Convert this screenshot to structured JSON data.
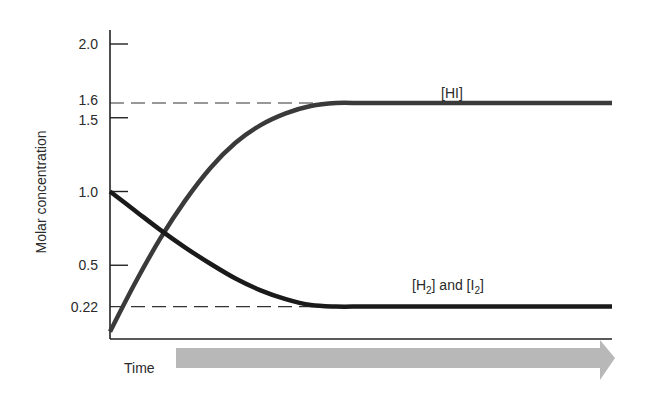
{
  "chart_data": {
    "type": "line",
    "title": "",
    "xlabel": "Time",
    "ylabel": "Molar concentration",
    "ylim": [
      0,
      2.0
    ],
    "xlim": [
      0,
      1
    ],
    "grid": false,
    "y_ticks": [
      {
        "value": 2.0,
        "label": "2.0",
        "tick": true
      },
      {
        "value": 1.6,
        "label": "1.6",
        "tick": false
      },
      {
        "value": 1.5,
        "label": "1.5",
        "tick": true
      },
      {
        "value": 1.0,
        "label": "1.0",
        "tick": true
      },
      {
        "value": 0.5,
        "label": "0.5",
        "tick": true
      },
      {
        "value": 0.22,
        "label": "0.22",
        "tick": false
      }
    ],
    "reference_lines": [
      {
        "name": "equilibrium-HI",
        "value": 1.6,
        "style": "dashed"
      },
      {
        "name": "equilibrium-H2-I2",
        "value": 0.22,
        "style": "dashed"
      }
    ],
    "series": [
      {
        "name": "[HI]",
        "color": "#3a3a3a",
        "x": [
          0.0,
          0.05,
          0.1,
          0.15,
          0.2,
          0.25,
          0.3,
          0.35,
          0.4,
          0.45,
          0.5,
          0.55,
          1.0
        ],
        "y": [
          0.05,
          0.38,
          0.68,
          0.94,
          1.16,
          1.33,
          1.45,
          1.53,
          1.58,
          1.6,
          1.6,
          1.6,
          1.6
        ]
      },
      {
        "name": "[H2] and [I2]",
        "color": "#1a1a1a",
        "x": [
          0.0,
          0.05,
          0.1,
          0.15,
          0.2,
          0.25,
          0.3,
          0.35,
          0.4,
          0.45,
          0.5,
          0.55,
          1.0
        ],
        "y": [
          1.0,
          0.87,
          0.74,
          0.62,
          0.51,
          0.41,
          0.33,
          0.27,
          0.23,
          0.22,
          0.22,
          0.22,
          0.22
        ]
      }
    ],
    "annotations": {
      "hi_label": "[HI]",
      "h2i2_label_parts": [
        "[H",
        "2",
        "] and [I",
        "2",
        "]"
      ]
    },
    "time_arrow_color": "#b8b8b8"
  }
}
